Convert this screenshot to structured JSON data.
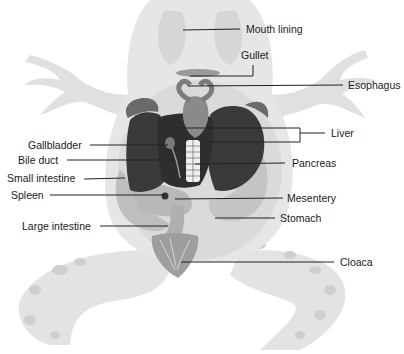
{
  "diagram": {
    "labels": {
      "mouth_lining": "Mouth lining",
      "gullet": "Gullet",
      "esophagus": "Esophagus",
      "liver": "Liver",
      "gallbladder": "Gallbladder",
      "bile_duct": "Bile duct",
      "pancreas": "Pancreas",
      "small_intestine": "Small intestine",
      "spleen": "Spleen",
      "mesentery": "Mesentery",
      "stomach": "Stomach",
      "large_intestine": "Large intestine",
      "cloaca": "Cloaca"
    },
    "colors": {
      "background": "#ffffff",
      "body_skin": "#e6e6e6",
      "body_shadow": "#d2d2d2",
      "liver": "#3c3c3c",
      "heart": "#8a8a8a",
      "intestine": "#bdbdbd",
      "leader_line": "#222222",
      "text": "#1a1a1a"
    }
  }
}
